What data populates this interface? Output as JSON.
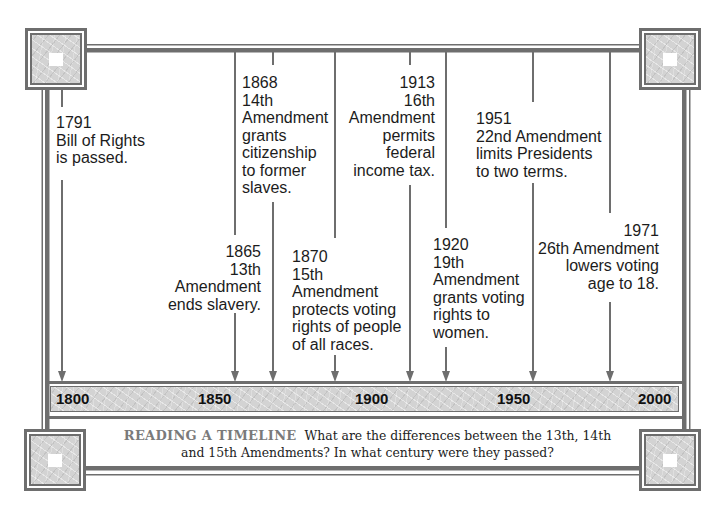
{
  "timeline": {
    "axis_labels": [
      "1800",
      "1850",
      "1900",
      "1950",
      "2000"
    ],
    "events": [
      {
        "year": "1791",
        "lines": [
          "1791",
          "Bill of Rights",
          "is passed."
        ]
      },
      {
        "year": "1865",
        "lines": [
          "1865",
          "13th",
          "Amendment",
          "ends slavery."
        ]
      },
      {
        "year": "1868",
        "lines": [
          "1868",
          "14th",
          "Amendment",
          "grants",
          "citizenship",
          "to former",
          "slaves."
        ]
      },
      {
        "year": "1870",
        "lines": [
          "1870",
          "15th",
          "Amendment",
          "protects voting",
          "rights of people",
          "of all races."
        ]
      },
      {
        "year": "1913",
        "lines": [
          "1913",
          "16th",
          "Amendment",
          "permits",
          "federal",
          "income tax."
        ]
      },
      {
        "year": "1920",
        "lines": [
          "1920",
          "19th",
          "Amendment",
          "grants voting",
          "rights to",
          "women."
        ]
      },
      {
        "year": "1951",
        "lines": [
          "1951",
          "22nd Amendment",
          "limits Presidents",
          "to two terms."
        ]
      },
      {
        "year": "1971",
        "lines": [
          "1971",
          "26th Amendment",
          "lowers voting",
          "age to 18."
        ]
      }
    ]
  },
  "caption": {
    "heading": "READING A TIMELINE",
    "line1": "What are the differences between the 13th, 14th",
    "line2": "and 15th Amendments? In what century were they passed?"
  },
  "colors": {
    "frame": "#6e6e6e",
    "texture": "#d3d3d3",
    "text": "#1c1c1c",
    "caption_heading": "#7a7a7a"
  }
}
